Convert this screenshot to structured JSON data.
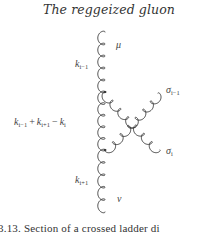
{
  "running_head": "The reggeized gluon",
  "figure": {
    "labels": {
      "mu": "μ",
      "nu": "ν",
      "k_prev": {
        "base": "k",
        "sub": "i−1"
      },
      "k_next": {
        "base": "k",
        "sub": "i+1"
      },
      "k_sum": {
        "t1": {
          "base": "k",
          "sub": "i−1"
        },
        "op1": "+",
        "t2": {
          "base": "k",
          "sub": "i+1"
        },
        "op2": "−",
        "t3": {
          "base": "k",
          "sub": "i"
        }
      },
      "sigma_prev": {
        "base": "σ",
        "sub": "i−1"
      },
      "sigma_i": {
        "base": "σ",
        "sub": "i"
      }
    },
    "lines": [
      {
        "name": "gluon-k-prev",
        "type": "gluon"
      },
      {
        "name": "gluon-k-sum",
        "type": "gluon"
      },
      {
        "name": "gluon-k-next",
        "type": "gluon"
      },
      {
        "name": "gluon-sigma-prev",
        "type": "gluon"
      },
      {
        "name": "gluon-sigma-i",
        "type": "gluon"
      }
    ],
    "caption": "3.13. Section of a crossed ladder di"
  },
  "colors": {
    "ink": "#333333",
    "background": "#ffffff"
  }
}
